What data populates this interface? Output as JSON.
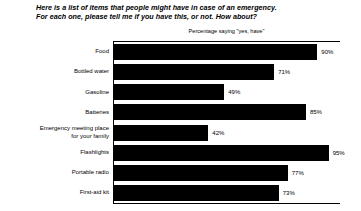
{
  "chart_data": {
    "type": "bar",
    "orientation": "horizontal",
    "title": "Here is a list of items that people might have in case of an emergency. For each one, please tell me if you have this, or not.  How about?",
    "title_lines": [
      "Here is a list of items that people might have in case of an emergency.",
      "For each one, please tell me if you have this, or not.  How about?"
    ],
    "subtitle": "Percentage saying \"yes, have\"",
    "categories": [
      "Food",
      "Bottled water",
      "Gasoline",
      "Batteries",
      "Emergency meeting place\nfor your family",
      "Flashlights",
      "Portable radio",
      "First-aid kit"
    ],
    "values": [
      90,
      71,
      49,
      85,
      42,
      95,
      77,
      73
    ],
    "value_labels": [
      "90%",
      "71%",
      "49%",
      "85%",
      "42%",
      "95%",
      "77%",
      "73%"
    ],
    "xlabel": "",
    "ylabel": "",
    "xlim": [
      0,
      100
    ],
    "grid": false,
    "legend": false,
    "bar_color": "#000000",
    "background_color": "#ffffff"
  }
}
